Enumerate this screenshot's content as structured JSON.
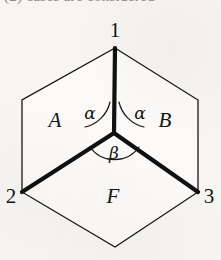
{
  "page": {
    "width": 221,
    "height": 260,
    "background_color": "#f6f5f2",
    "ink_color": "#141414",
    "cropped_header_text": "(2) cases are considered"
  },
  "figure": {
    "name": "hexagon-with-central-y-junction",
    "thin_stroke_width": 1.3,
    "thick_stroke_width": 4.2,
    "arc_stroke_width": 1.2,
    "hexagon_vertices": [
      {
        "name": "top",
        "x": 115,
        "y": 48
      },
      {
        "name": "upper-right",
        "x": 198,
        "y": 100
      },
      {
        "name": "lower-right",
        "x": 198,
        "y": 192
      },
      {
        "name": "bottom",
        "x": 115,
        "y": 247
      },
      {
        "name": "lower-left",
        "x": 22,
        "y": 192
      },
      {
        "name": "upper-left",
        "x": 22,
        "y": 100
      }
    ],
    "center_vertex": {
      "x": 114,
      "y": 133
    },
    "thick_edges": [
      {
        "name": "edge-center-to-vertex-1",
        "from": [
          114,
          133
        ],
        "to": [
          115,
          48
        ]
      },
      {
        "name": "edge-center-to-vertex-2",
        "from": [
          114,
          133
        ],
        "to": [
          22,
          192
        ]
      },
      {
        "name": "edge-center-to-vertex-3",
        "from": [
          114,
          133
        ],
        "to": [
          198,
          192
        ]
      }
    ]
  },
  "vertex_labels": [
    {
      "name": "vertex-label-1",
      "text": "1",
      "x": 115,
      "y": 30
    },
    {
      "name": "vertex-label-2",
      "text": "2",
      "x": 11,
      "y": 196
    },
    {
      "name": "vertex-label-3",
      "text": "3",
      "x": 209,
      "y": 196
    }
  ],
  "region_labels": [
    {
      "name": "region-label-a",
      "text": "A",
      "x": 55,
      "y": 120
    },
    {
      "name": "region-label-b",
      "text": "B",
      "x": 165,
      "y": 120
    },
    {
      "name": "region-label-f",
      "text": "F",
      "x": 113,
      "y": 196
    }
  ],
  "angle_labels": [
    {
      "name": "angle-label-alpha-left",
      "text": "α",
      "x": 90,
      "y": 113
    },
    {
      "name": "angle-label-alpha-right",
      "text": "α",
      "x": 140,
      "y": 113
    },
    {
      "name": "angle-label-beta",
      "text": "β",
      "x": 114,
      "y": 153
    }
  ],
  "angle_arcs": [
    {
      "name": "arc-alpha-left",
      "path": "M 110 102 A 33 33 0 0 1 85 127"
    },
    {
      "name": "arc-alpha-right",
      "path": "M 119 102 A 33 33 0 0 0 144 127"
    },
    {
      "name": "arc-beta",
      "path": "M 90 147 A 30 30 0 0 0 139 147"
    }
  ]
}
